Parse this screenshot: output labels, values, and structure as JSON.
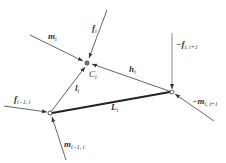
{
  "diagram": {
    "nodes": [
      {
        "id": "C_i",
        "label": "C",
        "sub": "i",
        "x": 87,
        "y": 63
      },
      {
        "id": "left",
        "x": 50,
        "y": 113
      },
      {
        "id": "right",
        "x": 172,
        "y": 92
      }
    ],
    "labels": {
      "m_i": {
        "main": "m",
        "sub": "i"
      },
      "f_i": {
        "main": "f",
        "sub": "i"
      },
      "C_i": {
        "main": "C",
        "sub": "i"
      },
      "h_i": {
        "main": "h",
        "sub": "i"
      },
      "l_i": {
        "main": "l",
        "sub": "i"
      },
      "L_i": {
        "main": "L",
        "sub": "i"
      },
      "f_im1_i": {
        "main": "f",
        "sub": "i−1, i"
      },
      "m_im1_i": {
        "main": "m",
        "sub": "i−1, i"
      },
      "neg_f_i_ip1": {
        "main": "−f",
        "sub": "i, i+1"
      },
      "neg_m_i_ip1": {
        "main": "−m",
        "sub": "i, i+1"
      }
    },
    "colors": {
      "line": "#555555",
      "thick": "#222222",
      "text": "#333333"
    }
  }
}
